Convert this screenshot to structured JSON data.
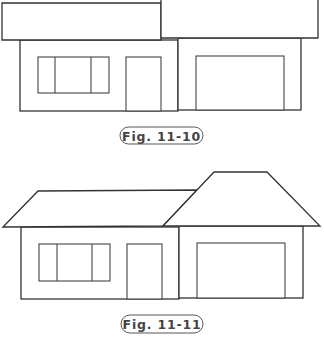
{
  "colors": {
    "stroke": "#333333",
    "background": "#ffffff",
    "caption_text": "#444444"
  },
  "figures": [
    {
      "caption": "Fig. 11-10",
      "caption_box": {
        "x": 120,
        "y": 127,
        "w": 83,
        "h": 17
      },
      "roof_style": "flat-rectangles",
      "roofs": [
        {
          "name": "left-roof",
          "points": "2,3 161,3 161,40 2,40"
        },
        {
          "name": "right-roof",
          "points": "161,-2 318,-2 318,38 161,38"
        }
      ],
      "left_wall": {
        "x": 20,
        "y": 40,
        "w": 158,
        "h": 71
      },
      "right_wall": {
        "x": 178,
        "y": 38,
        "w": 123,
        "h": 72
      },
      "window": {
        "x": 38,
        "y": 57,
        "w": 71,
        "h": 36,
        "dividers": [
          55,
          91
        ]
      },
      "door": {
        "x": 126,
        "y": 57,
        "w": 35,
        "h": 54
      },
      "garage_door": {
        "x": 196,
        "y": 56,
        "w": 88,
        "h": 54
      }
    },
    {
      "caption": "Fig. 11-11",
      "caption_box": {
        "x": 121,
        "y": 315,
        "w": 82,
        "h": 18
      },
      "roof_style": "hip-trapezoids",
      "roofs": [
        {
          "name": "left-roof",
          "points": "3,227 38,191 197,190 163,226"
        },
        {
          "name": "right-roof",
          "points": "163,226 214,172 267,172 320,226"
        }
      ],
      "left_wall": {
        "x": 21,
        "y": 227,
        "w": 158,
        "h": 72
      },
      "right_wall": {
        "x": 179,
        "y": 226,
        "w": 124,
        "h": 72
      },
      "window": {
        "x": 39,
        "y": 244,
        "w": 71,
        "h": 37,
        "dividers": [
          57,
          92
        ]
      },
      "door": {
        "x": 127,
        "y": 244,
        "w": 35,
        "h": 55
      },
      "garage_door": {
        "x": 197,
        "y": 243,
        "w": 88,
        "h": 55
      }
    }
  ]
}
